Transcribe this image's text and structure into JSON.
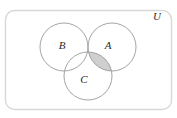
{
  "diagram": {
    "type": "venn-diagram",
    "title": "",
    "universe": {
      "label": "U",
      "label_x": 157,
      "label_y": 17,
      "border_color": "#d8d8d8",
      "fill_color": "#ffffff",
      "x": 5,
      "y": 10,
      "width": 167,
      "height": 100,
      "corner_radius": 9
    },
    "circles": [
      {
        "label": "B",
        "cx": 64,
        "cy": 47,
        "r": 24,
        "label_x": 62,
        "label_y": 46,
        "stroke_color": "#9a9a9a",
        "fill_color": "none"
      },
      {
        "label": "A",
        "cx": 112,
        "cy": 47,
        "r": 24,
        "label_x": 108,
        "label_y": 46,
        "stroke_color": "#9a9a9a",
        "fill_color": "none"
      },
      {
        "label": "C",
        "cx": 88,
        "cy": 76,
        "r": 24,
        "label_x": 84,
        "label_y": 80,
        "stroke_color": "#9a9a9a",
        "fill_color": "none"
      }
    ],
    "shaded_regions": [
      {
        "name": "A-intersect-C-minus-B",
        "description": "A ∩ C ∩ B'",
        "fill_color": "#cccccc",
        "stroke_color": "#9a9a9a"
      }
    ]
  }
}
